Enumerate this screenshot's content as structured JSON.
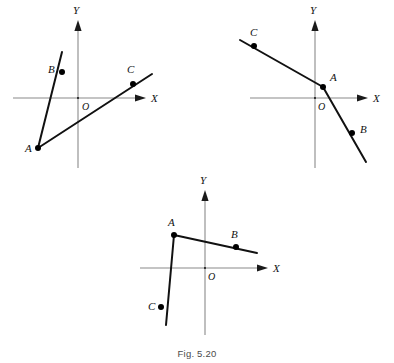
{
  "figure": {
    "caption": "Fig. 5.20",
    "caption_y": 348,
    "stroke_color": "#111111",
    "axis_color": "#8a8a8a",
    "point_color": "#000000"
  },
  "chart_data": {
    "type": "scatter",
    "title": "Fig. 5.20",
    "xlabel": "X",
    "ylabel": "Y",
    "grid": false,
    "legend": null,
    "panels": [
      {
        "name": "panel-1",
        "origin": {
          "x": 78,
          "y": 98,
          "label": "O",
          "label_x": 82,
          "label_y": 110
        },
        "x_axis": {
          "x1": 13,
          "y1": 98,
          "x2": 136,
          "y2": 98,
          "arrow_tip_x": 146,
          "label": "X",
          "label_x": 151,
          "label_y": 102
        },
        "y_axis": {
          "x1": 78,
          "y1": 168,
          "x2": 78,
          "y2": 30,
          "arrow_tip_y": 20,
          "label": "Y",
          "label_x": 73,
          "label_y": 14
        },
        "segments": [
          {
            "name": "segment-AB",
            "points": [
              [
                38,
                148
              ],
              [
                62,
                52
              ]
            ]
          },
          {
            "name": "segment-AC",
            "points": [
              [
                38,
                148
              ],
              [
                152,
                74
              ]
            ]
          }
        ],
        "points": [
          {
            "label": "A",
            "x": 38,
            "y": 148,
            "label_x": 25,
            "label_y": 152
          },
          {
            "label": "B",
            "x": 62,
            "y": 72,
            "label_x": 48,
            "label_y": 73
          },
          {
            "label": "C",
            "x": 133,
            "y": 84,
            "label_x": 127,
            "label_y": 73
          }
        ]
      },
      {
        "name": "panel-2",
        "origin": {
          "x": 315,
          "y": 98,
          "label": "O",
          "label_x": 318,
          "label_y": 110
        },
        "x_axis": {
          "x1": 250,
          "y1": 98,
          "x2": 358,
          "y2": 98,
          "arrow_tip_x": 368,
          "label": "X",
          "label_x": 373,
          "label_y": 102
        },
        "y_axis": {
          "x1": 315,
          "y1": 168,
          "x2": 315,
          "y2": 30,
          "arrow_tip_y": 20,
          "label": "Y",
          "label_x": 310,
          "label_y": 14
        },
        "segments": [
          {
            "name": "polyline-CAB",
            "points": [
              [
                240,
                40
              ],
              [
                323,
                87
              ],
              [
                366,
                162
              ]
            ]
          }
        ],
        "points": [
          {
            "label": "C",
            "x": 254,
            "y": 46,
            "label_x": 250,
            "label_y": 36
          },
          {
            "label": "A",
            "x": 323,
            "y": 87,
            "label_x": 330,
            "label_y": 81
          },
          {
            "label": "B",
            "x": 352,
            "y": 133,
            "label_x": 360,
            "label_y": 133
          }
        ]
      },
      {
        "name": "panel-3",
        "origin": {
          "x": 205,
          "y": 268,
          "label": "O",
          "label_x": 208,
          "label_y": 280
        },
        "x_axis": {
          "x1": 140,
          "y1": 268,
          "x2": 258,
          "y2": 268,
          "arrow_tip_x": 268,
          "label": "X",
          "label_x": 273,
          "label_y": 272
        },
        "y_axis": {
          "x1": 205,
          "y1": 335,
          "x2": 205,
          "y2": 200,
          "arrow_tip_y": 190,
          "label": "Y",
          "label_x": 200,
          "label_y": 184
        },
        "segments": [
          {
            "name": "polyline-CAB",
            "points": [
              [
                166,
                325
              ],
              [
                174,
                235
              ],
              [
                257,
                253
              ]
            ]
          }
        ],
        "points": [
          {
            "label": "A",
            "x": 174,
            "y": 235,
            "label_x": 168,
            "label_y": 226
          },
          {
            "label": "B",
            "x": 236,
            "y": 247,
            "label_x": 231,
            "label_y": 238
          },
          {
            "label": "C",
            "x": 161,
            "y": 307,
            "label_x": 148,
            "label_y": 310
          }
        ]
      }
    ]
  }
}
